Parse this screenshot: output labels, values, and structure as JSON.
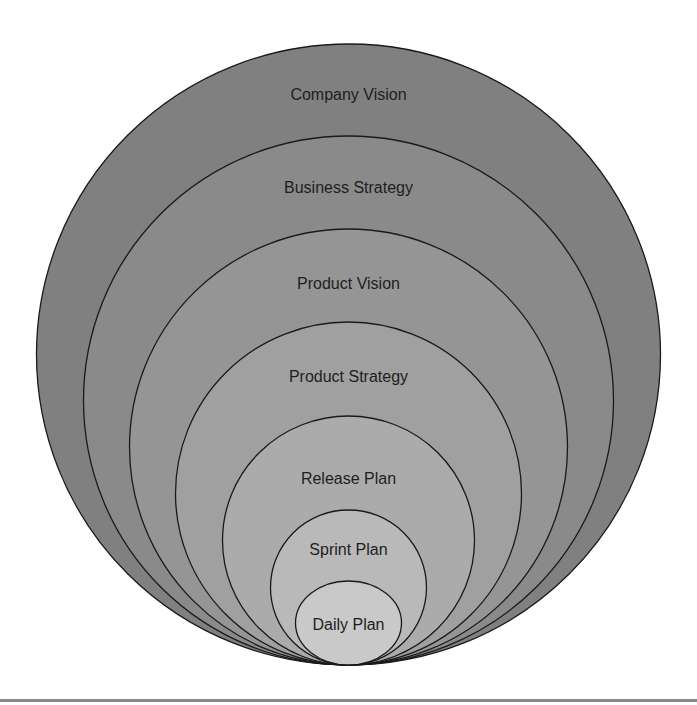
{
  "diagram": {
    "center_x": 348.5,
    "tangent_y": 665,
    "rings": [
      {
        "label": "Company Vision",
        "top": 44,
        "rx": 312,
        "fill": "#808080",
        "label_y": 100
      },
      {
        "label": "Business Strategy",
        "top": 136,
        "rx": 265,
        "fill": "#8a8a8a",
        "label_y": 193
      },
      {
        "label": "Product Vision",
        "top": 229,
        "rx": 219,
        "fill": "#959595",
        "label_y": 289
      },
      {
        "label": "Product Strategy",
        "top": 322,
        "rx": 173,
        "fill": "#a0a0a0",
        "label_y": 382
      },
      {
        "label": "Release Plan",
        "top": 416,
        "rx": 126,
        "fill": "#ababab",
        "label_y": 484
      },
      {
        "label": "Sprint Plan",
        "top": 510,
        "rx": 78,
        "fill": "#b9b9b9",
        "label_y": 555
      },
      {
        "label": "Daily Plan",
        "top": 581,
        "rx": 53,
        "fill": "#c9c9c9",
        "label_y": 630
      }
    ],
    "stroke_color": "#1a1a1a",
    "text_color": "#1e1e1e"
  },
  "rule": {
    "color": "#8a8a8a"
  }
}
